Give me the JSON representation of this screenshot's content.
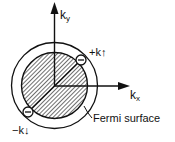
{
  "figure": {
    "type": "Fermi sphere diagram with Cooper pair",
    "axes": {
      "y": {
        "label_main": "k",
        "label_sub": "y"
      },
      "x": {
        "label_main": "k",
        "label_sub": "x"
      }
    },
    "electrons": [
      {
        "label": "+k",
        "spin": "↑",
        "charge_sign": "−",
        "position": "upper-right on Fermi surface"
      },
      {
        "label": "−k",
        "spin": "↓",
        "charge_sign": "−",
        "position": "lower-left on Fermi surface"
      }
    ],
    "annotation": "Fermi surface",
    "colors": {
      "ink": "#111111",
      "background": "#ffffff"
    }
  },
  "labels": {
    "ky_main": "k",
    "ky_sub": "y",
    "kx_main": "k",
    "kx_sub": "x",
    "plus_k": "+k",
    "plus_spin": "↑",
    "minus_k": "−k",
    "minus_spin": "↓",
    "fermi_surface": "Fermi surface",
    "electron_sign": "−"
  }
}
